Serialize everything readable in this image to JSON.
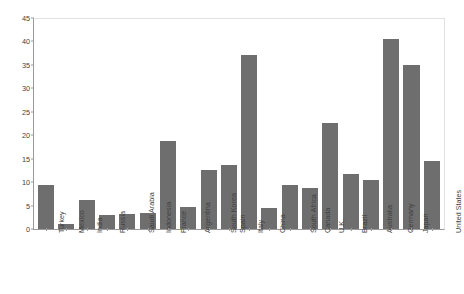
{
  "chart_data": {
    "type": "bar",
    "title": "",
    "xlabel": "",
    "ylabel": "",
    "ylim": [
      0,
      45
    ],
    "ytick_step": 5,
    "grid": false,
    "legend_position": "top-center",
    "bar_color": "#6e6e6e",
    "categories": [
      "Turkey",
      "Mexico",
      "India",
      "Russia",
      "Saudi Arabia",
      "Indonesia",
      "France",
      "Argentina",
      "South Korea",
      "Spain",
      "Italy",
      "China",
      "South Africa",
      "Canada",
      "U.K.",
      "Brazil",
      "Australia",
      "Germany",
      "Japan",
      "United States"
    ],
    "series": [
      {
        "name": "Additional spending and tax cuts",
        "color": "#6e6e6e",
        "values": [
          9.4,
          1.1,
          6.1,
          2.9,
          3.1,
          3.5,
          18.8,
          4.6,
          12.6,
          13.7,
          37.2,
          4.4,
          9.4,
          8.8,
          22.6,
          11.7,
          10.5,
          40.5,
          34.9,
          14.4
        ]
      }
    ],
    "ytick_labels": [
      "0",
      "5",
      "10",
      "15",
      "20",
      "25",
      "30",
      "35",
      "40",
      "45"
    ],
    "ytick_values": [
      0,
      5,
      10,
      15,
      20,
      25,
      30,
      35,
      40,
      45
    ],
    "legend": [
      {
        "label": "Additional spending and tax cuts",
        "color": "#6e6e6e"
      },
      {
        "label": "Loans, equity, and guarantees",
        "color": "#6e6e6e"
      }
    ]
  }
}
